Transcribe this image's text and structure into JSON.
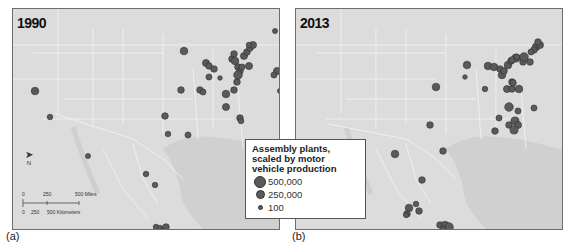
{
  "figure": {
    "panels": [
      {
        "id": "a",
        "year": "1990",
        "caption": "(a)"
      },
      {
        "id": "b",
        "year": "2013",
        "caption": "(b)"
      }
    ],
    "legend": {
      "title": "Assembly plants, scaled by motor vehicle production",
      "title_lines": [
        "Assembly plants,",
        "scaled by motor",
        "vehicle production"
      ],
      "items": [
        {
          "label": "500,000",
          "size": 10
        },
        {
          "label": "250,000",
          "size": 7
        },
        {
          "label": "100",
          "size": 3
        }
      ]
    },
    "scale_bar": {
      "miles_ticks": [
        "0",
        "250",
        "500 Miles"
      ],
      "km_ticks": [
        "0",
        "250",
        "500 Kilometers"
      ]
    },
    "north_arrow": {
      "label": "N"
    },
    "colors": {
      "land": "#dcdcdc",
      "water": "#d2d2d2",
      "borders": "#f4f4f4",
      "plant_fill": "#5a5a5a",
      "plant_stroke": "#2e2e2e"
    },
    "plants_1990": [
      [
        22,
        82,
        6
      ],
      [
        37,
        108,
        4
      ],
      [
        75,
        147,
        3.5
      ],
      [
        133,
        165,
        4
      ],
      [
        171,
        42,
        6
      ],
      [
        168,
        81,
        5
      ],
      [
        187,
        81,
        5
      ],
      [
        190,
        83,
        4.5
      ],
      [
        193,
        54,
        5.5
      ],
      [
        196,
        57,
        5
      ],
      [
        201,
        60,
        5
      ],
      [
        196,
        68,
        4.5
      ],
      [
        207,
        69,
        3
      ],
      [
        213,
        85,
        6
      ],
      [
        221,
        81,
        5
      ],
      [
        213,
        98,
        5.5
      ],
      [
        219,
        50,
        5
      ],
      [
        221,
        45,
        5
      ],
      [
        222,
        52,
        6
      ],
      [
        225,
        58,
        5
      ],
      [
        227,
        62,
        5
      ],
      [
        229,
        58,
        4.5
      ],
      [
        236,
        57,
        5.5
      ],
      [
        225,
        66,
        7
      ],
      [
        224,
        73,
        5
      ],
      [
        231,
        47,
        5.5
      ],
      [
        234,
        43,
        5
      ],
      [
        237,
        39,
        5
      ],
      [
        240,
        36,
        5.5
      ],
      [
        236,
        36,
        4
      ],
      [
        262,
        22,
        3.5
      ],
      [
        271,
        51,
        5
      ],
      [
        271,
        54,
        4
      ],
      [
        264,
        62,
        5.5
      ],
      [
        261,
        66,
        4.5
      ],
      [
        267,
        82,
        3.5
      ],
      [
        152,
        107,
        5
      ],
      [
        155,
        125,
        4
      ],
      [
        175,
        126,
        4.5
      ],
      [
        227,
        109,
        5
      ],
      [
        228,
        112,
        4
      ],
      [
        142,
        176,
        4
      ],
      [
        143,
        218,
        4
      ],
      [
        147,
        219,
        4
      ],
      [
        150,
        221,
        4
      ],
      [
        153,
        218,
        5
      ]
    ],
    "plants_2013": [
      [
        140,
        78,
        6
      ],
      [
        99,
        145,
        6
      ],
      [
        134,
        116,
        5
      ],
      [
        147,
        142,
        5
      ],
      [
        126,
        171,
        5
      ],
      [
        113,
        199,
        6
      ],
      [
        111,
        205,
        5
      ],
      [
        123,
        202,
        5
      ],
      [
        120,
        195,
        4
      ],
      [
        110,
        206,
        3.5
      ],
      [
        144,
        216,
        5
      ],
      [
        149,
        216,
        6
      ],
      [
        153,
        218,
        7
      ],
      [
        147,
        220,
        4
      ],
      [
        171,
        56,
        6
      ],
      [
        169,
        68,
        3
      ],
      [
        192,
        57,
        6
      ],
      [
        198,
        58,
        6
      ],
      [
        204,
        60,
        5
      ],
      [
        206,
        66,
        6
      ],
      [
        212,
        56,
        6
      ],
      [
        215,
        52,
        5
      ],
      [
        220,
        49,
        6.5
      ],
      [
        216,
        51,
        5
      ],
      [
        208,
        62,
        5
      ],
      [
        221,
        48,
        4
      ],
      [
        227,
        53,
        5
      ],
      [
        234,
        53,
        5
      ],
      [
        240,
        38,
        6
      ],
      [
        244,
        36,
        5.5
      ],
      [
        242,
        33,
        5
      ],
      [
        238,
        41,
        5
      ],
      [
        235,
        43,
        4.5
      ],
      [
        228,
        48,
        7
      ],
      [
        216,
        73,
        5
      ],
      [
        211,
        80,
        5.5
      ],
      [
        216,
        80,
        5
      ],
      [
        217,
        74,
        5
      ],
      [
        223,
        80,
        6
      ],
      [
        189,
        80,
        4
      ],
      [
        213,
        98,
        7
      ],
      [
        222,
        102,
        4.5
      ],
      [
        238,
        99,
        4.5
      ],
      [
        203,
        109,
        4.5
      ],
      [
        213,
        116,
        5
      ],
      [
        219,
        112,
        6.5
      ],
      [
        222,
        116,
        5.5
      ],
      [
        218,
        121,
        6.5
      ],
      [
        199,
        122,
        5
      ]
    ]
  }
}
